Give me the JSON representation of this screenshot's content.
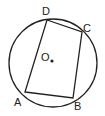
{
  "diagram": {
    "type": "circle-inscribed-quadrilateral",
    "circle": {
      "center_label": "O",
      "cx": 53,
      "cy": 63,
      "r": 44
    },
    "vertices": [
      {
        "label": "A",
        "x": 25,
        "y": 92,
        "lx": 14,
        "ly": 106
      },
      {
        "label": "B",
        "x": 73,
        "y": 98,
        "lx": 74,
        "ly": 110
      },
      {
        "label": "C",
        "x": 82,
        "y": 32,
        "lx": 83,
        "ly": 32
      },
      {
        "label": "D",
        "x": 47,
        "y": 20,
        "lx": 42,
        "ly": 15
      }
    ],
    "center": {
      "label": "O",
      "dot_x": 52,
      "dot_y": 61,
      "lx": 41,
      "ly": 61
    },
    "colors": {
      "stroke": "#222222",
      "background": "#ffffff"
    }
  }
}
